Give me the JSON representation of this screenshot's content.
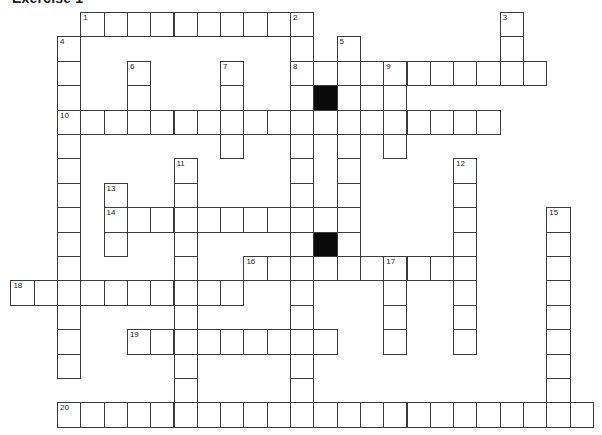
{
  "title": "Exercise 1",
  "grid": {
    "origin_x": 57,
    "origin_y": 12,
    "cell_width": 23.3,
    "cell_height": 24.4,
    "line_color": "#3a3a3a",
    "black_color": "#0a0a0a"
  },
  "entries": [
    {
      "number": 1,
      "direction": "across",
      "row": 0,
      "col": 1,
      "length": 10
    },
    {
      "number": 2,
      "direction": "down",
      "row": 0,
      "col": 10,
      "length": 17
    },
    {
      "number": 3,
      "direction": "down",
      "row": 0,
      "col": 19,
      "length": 3
    },
    {
      "number": 4,
      "direction": "down",
      "row": 1,
      "col": 0,
      "length": 14
    },
    {
      "number": 5,
      "direction": "down",
      "row": 1,
      "col": 12,
      "length": 10
    },
    {
      "number": 6,
      "direction": "down",
      "row": 2,
      "col": 3,
      "length": 3
    },
    {
      "number": 7,
      "direction": "down",
      "row": 2,
      "col": 7,
      "length": 4
    },
    {
      "number": 8,
      "direction": "across",
      "row": 2,
      "col": 10,
      "length": 11
    },
    {
      "number": 9,
      "direction": "down",
      "row": 2,
      "col": 14,
      "length": 4
    },
    {
      "number": 10,
      "direction": "across",
      "row": 4,
      "col": 0,
      "length": 19
    },
    {
      "number": 11,
      "direction": "down",
      "row": 6,
      "col": 5,
      "length": 11
    },
    {
      "number": 12,
      "direction": "down",
      "row": 6,
      "col": 17,
      "length": 8
    },
    {
      "number": 13,
      "direction": "down",
      "row": 7,
      "col": 2,
      "length": 3
    },
    {
      "number": 14,
      "direction": "across",
      "row": 8,
      "col": 2,
      "length": 11
    },
    {
      "number": 15,
      "direction": "down",
      "row": 8,
      "col": 21,
      "length": 9
    },
    {
      "number": 16,
      "direction": "across",
      "row": 10,
      "col": 8,
      "length": 10
    },
    {
      "number": 17,
      "direction": "down",
      "row": 10,
      "col": 14,
      "length": 4
    },
    {
      "number": 18,
      "direction": "across",
      "row": 11,
      "col": -2,
      "length": 10
    },
    {
      "number": 19,
      "direction": "across",
      "row": 13,
      "col": 3,
      "length": 9
    },
    {
      "number": 20,
      "direction": "across",
      "row": 16,
      "col": 0,
      "length": 23
    }
  ],
  "black_cells": [
    {
      "row": 3,
      "col": 11
    },
    {
      "row": 9,
      "col": 11
    }
  ]
}
